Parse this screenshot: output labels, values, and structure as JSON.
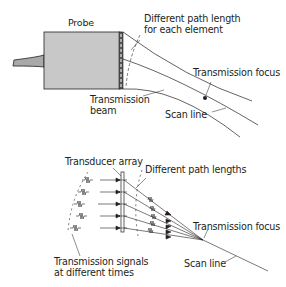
{
  "top_panel": {
    "probe_label": "Probe",
    "path_length_label_line1": "Different path length",
    "path_length_label_line2": "for each element",
    "transmission_focus_label": "Transmission focus",
    "transmission_beam_label_line1": "Transmission",
    "transmission_beam_label_line2": "beam",
    "scan_line_label": "Scan line"
  },
  "bottom_panel": {
    "transducer_array_label": "Transducer array",
    "path_lengths_label": "Different path lengths",
    "transmission_focus_label": "Transmission focus",
    "signals_label_line1": "Transmission signals",
    "signals_label_line2": "at different times",
    "scan_line_label": "Scan line"
  },
  "colors": {
    "line": "#231f20",
    "probe_fill": "#c8c8c8",
    "cable_fill": "#a9a9a9"
  }
}
